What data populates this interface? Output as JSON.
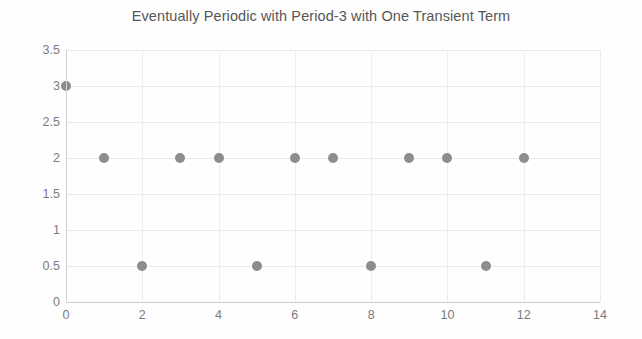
{
  "chart_data": {
    "type": "scatter",
    "title": "Eventually Periodic with Period-3 with One Transient Term",
    "xlabel": "",
    "ylabel": "",
    "x": [
      0,
      1,
      2,
      3,
      4,
      5,
      6,
      7,
      8,
      9,
      10,
      11,
      12
    ],
    "values": [
      3,
      2,
      0.5,
      2,
      2,
      0.5,
      2,
      2,
      0.5,
      2,
      2,
      0.5,
      2
    ],
    "series": [
      {
        "name": "sequence",
        "points": [
          {
            "x": 0,
            "y": 3
          },
          {
            "x": 1,
            "y": 2
          },
          {
            "x": 2,
            "y": 0.5
          },
          {
            "x": 3,
            "y": 2
          },
          {
            "x": 4,
            "y": 2
          },
          {
            "x": 5,
            "y": 0.5
          },
          {
            "x": 6,
            "y": 2
          },
          {
            "x": 7,
            "y": 2
          },
          {
            "x": 8,
            "y": 0.5
          },
          {
            "x": 9,
            "y": 2
          },
          {
            "x": 10,
            "y": 2
          },
          {
            "x": 11,
            "y": 0.5
          },
          {
            "x": 12,
            "y": 2
          }
        ],
        "marker_color": "#8d8d8e",
        "marker_shape": "circle"
      }
    ],
    "xlim": [
      0,
      14
    ],
    "ylim": [
      0,
      3.5
    ],
    "xticks": [
      0,
      2,
      4,
      6,
      8,
      10,
      12,
      14
    ],
    "xtick_labels": [
      "0",
      "2",
      "4",
      "6",
      "8",
      "10",
      "12",
      "14"
    ],
    "yticks": [
      0,
      0.5,
      1,
      1.5,
      2,
      2.5,
      3,
      3.5
    ],
    "ytick_labels": [
      "0",
      "0.5",
      "1",
      "1.5",
      "2",
      "2.5",
      "3",
      "3.5"
    ],
    "grid": true,
    "grid_color": "#e9e9ea",
    "legend": null,
    "legend_position": "none",
    "background_color": "#fefefe",
    "title_color": "#575757",
    "tick_label_color": "#7b7b7d"
  }
}
